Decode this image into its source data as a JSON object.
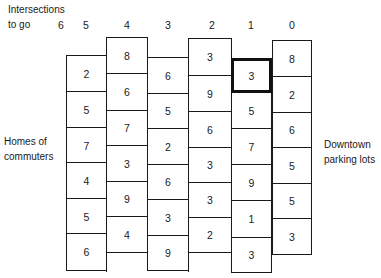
{
  "labels": {
    "top_left_line1": "Intersections",
    "top_left_line2": "to go",
    "left_line1": "Homes of",
    "left_line2": "commuters",
    "right_line1": "Downtown",
    "right_line2": "parking lots"
  },
  "column_headers": [
    "6",
    "5",
    "4",
    "3",
    "2",
    "1",
    "0"
  ],
  "columns": [
    {
      "intersections_to_go": "5",
      "values": [
        "2",
        "5",
        "7",
        "4",
        "5",
        "6"
      ]
    },
    {
      "intersections_to_go": "4",
      "values": [
        "8",
        "6",
        "7",
        "3",
        "9",
        "4"
      ]
    },
    {
      "intersections_to_go": "3",
      "values": [
        "6",
        "5",
        "2",
        "6",
        "3",
        "9"
      ]
    },
    {
      "intersections_to_go": "2",
      "values": [
        "3",
        "9",
        "6",
        "3",
        "3",
        "2"
      ]
    },
    {
      "intersections_to_go": "1",
      "values": [
        "3",
        "5",
        "7",
        "9",
        "1",
        "3"
      ],
      "highlighted_index": 0
    },
    {
      "intersections_to_go": "0",
      "values": [
        "8",
        "2",
        "6",
        "5",
        "5",
        "3"
      ]
    }
  ]
}
